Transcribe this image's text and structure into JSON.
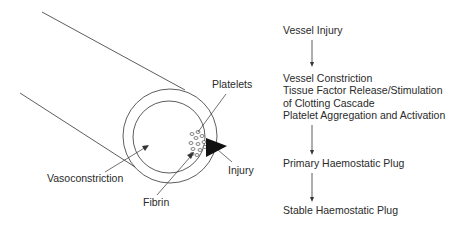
{
  "vessel_diagram": {
    "labels": {
      "platelets": "Platelets",
      "vasoconstriction": "Vasoconstriction",
      "fibrin": "Fibrin",
      "injury": "Injury"
    }
  },
  "flowchart": {
    "steps": [
      {
        "lines": [
          "Vessel Injury"
        ]
      },
      {
        "lines": [
          "Vessel Constriction",
          "Tissue Factor Release/Stimulation",
          "of Clotting Cascade",
          "Platelet Aggregation and Activation"
        ]
      },
      {
        "lines": [
          "Primary Haemostatic Plug"
        ]
      },
      {
        "lines": [
          "Stable Haemostatic Plug"
        ]
      }
    ]
  }
}
